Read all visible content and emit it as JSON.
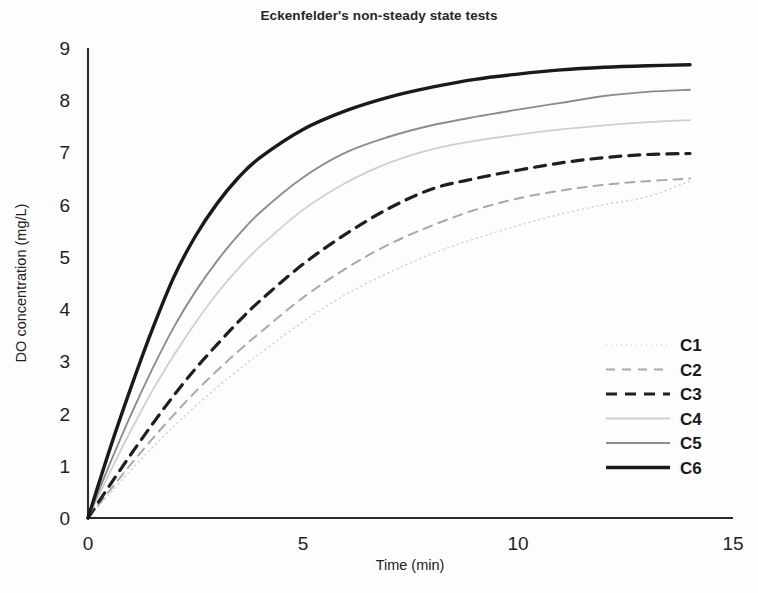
{
  "chart_data": {
    "type": "line",
    "title": "Eckenfelder's non-steady state tests",
    "subtitle": "",
    "xlabel": "Time (min)",
    "ylabel": "DO concentration (mg/L)",
    "xlim": [
      0,
      15
    ],
    "ylim": [
      0,
      9
    ],
    "xticks": [
      0,
      5,
      10,
      15
    ],
    "yticks": [
      0,
      1,
      2,
      3,
      4,
      5,
      6,
      7,
      8,
      9
    ],
    "xtick_labels": [
      "0",
      "5",
      "10",
      "15"
    ],
    "ytick_labels": [
      "0",
      "1",
      "2",
      "3",
      "4",
      "5",
      "6",
      "7",
      "8",
      "9"
    ],
    "grid": false,
    "legend_position": "right-inside",
    "x": [
      0,
      0.5,
      1,
      1.5,
      2,
      2.5,
      3,
      3.5,
      4,
      5,
      6,
      7,
      8,
      9,
      10,
      11,
      12,
      13,
      14
    ],
    "series": [
      {
        "name": "C1",
        "style": "dotted",
        "color": "#d6d6d6",
        "width": 1.6,
        "dash": "1,4",
        "values": [
          0,
          0.46,
          0.92,
          1.35,
          1.76,
          2.14,
          2.5,
          2.84,
          3.15,
          3.76,
          4.28,
          4.7,
          5.06,
          5.35,
          5.6,
          5.82,
          6.0,
          6.15,
          6.45
        ]
      },
      {
        "name": "C2",
        "style": "dashed",
        "color": "#a9a9a9",
        "width": 2.0,
        "dash": "9,7",
        "values": [
          0,
          0.52,
          1.03,
          1.52,
          1.98,
          2.42,
          2.82,
          3.2,
          3.55,
          4.22,
          4.78,
          5.24,
          5.6,
          5.9,
          6.12,
          6.27,
          6.38,
          6.45,
          6.5
        ]
      },
      {
        "name": "C3",
        "style": "dashed-bold",
        "color": "#1f1f1f",
        "width": 3.2,
        "dash": "11,8",
        "values": [
          0,
          0.62,
          1.22,
          1.8,
          2.35,
          2.86,
          3.32,
          3.76,
          4.16,
          4.86,
          5.44,
          5.93,
          6.3,
          6.5,
          6.66,
          6.8,
          6.9,
          6.96,
          6.98
        ]
      },
      {
        "name": "C4",
        "style": "solid-light",
        "color": "#cfcfcf",
        "width": 1.8,
        "dash": "none",
        "values": [
          0,
          0.86,
          1.68,
          2.44,
          3.12,
          3.74,
          4.3,
          4.78,
          5.2,
          5.9,
          6.42,
          6.8,
          7.06,
          7.22,
          7.34,
          7.44,
          7.52,
          7.58,
          7.62
        ]
      },
      {
        "name": "C5",
        "style": "solid-gray",
        "color": "#8c8c8c",
        "width": 1.9,
        "dash": "none",
        "values": [
          0,
          1.02,
          1.98,
          2.86,
          3.66,
          4.34,
          4.92,
          5.42,
          5.85,
          6.52,
          7.0,
          7.3,
          7.52,
          7.68,
          7.82,
          7.95,
          8.08,
          8.16,
          8.2
        ]
      },
      {
        "name": "C6",
        "style": "solid-bold",
        "color": "#1a1a1a",
        "width": 3.4,
        "dash": "none",
        "values": [
          0,
          1.3,
          2.5,
          3.62,
          4.62,
          5.4,
          6.02,
          6.52,
          6.9,
          7.44,
          7.8,
          8.06,
          8.25,
          8.4,
          8.5,
          8.58,
          8.63,
          8.66,
          8.68
        ]
      }
    ],
    "legend_entries": [
      "C1",
      "C2",
      "C3",
      "C4",
      "C5",
      "C6"
    ]
  }
}
